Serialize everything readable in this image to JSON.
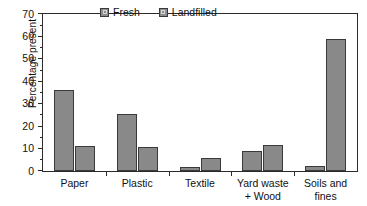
{
  "chart_data": {
    "type": "bar",
    "title": "",
    "xlabel": "",
    "ylabel": "Percentage present",
    "ylim": [
      0,
      70
    ],
    "ytick_step": 10,
    "yminor_step": 5,
    "grid": false,
    "legend_position": "top-center",
    "categories": [
      "Paper",
      "Plastic",
      "Textile",
      "Yard waste\n+ Wood",
      "Soils and\nfines"
    ],
    "ytick_labels": [
      "0",
      "10",
      "20",
      "30",
      "40",
      "50",
      "60",
      "70"
    ],
    "series": [
      {
        "name": "Fresh",
        "color": "#898989",
        "values": [
          36.2,
          25.2,
          1.8,
          8.8,
          2.4
        ]
      },
      {
        "name": "Landfilled",
        "color": "#898989",
        "values": [
          11.2,
          10.9,
          5.8,
          11.4,
          58.7
        ]
      }
    ]
  },
  "legend": {
    "items": [
      {
        "label": "Fresh"
      },
      {
        "label": "Landfilled"
      }
    ]
  },
  "axis": {
    "y_title": "Percentage present"
  }
}
